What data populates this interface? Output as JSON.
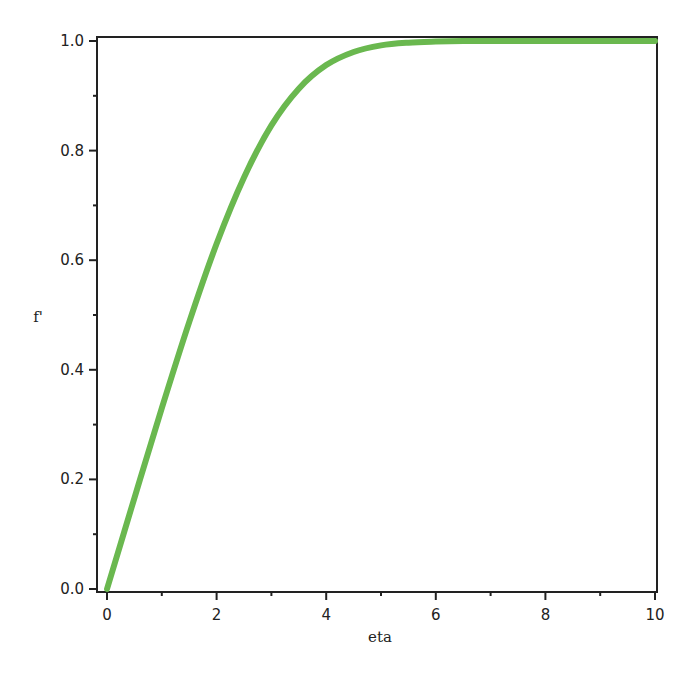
{
  "chart_data": {
    "type": "line",
    "title": "",
    "xlabel": "eta",
    "ylabel": "f'",
    "xlim": [
      0,
      10
    ],
    "ylim": [
      0,
      1.0
    ],
    "x_ticks": [
      "0",
      "2",
      "4",
      "6",
      "8",
      "10"
    ],
    "y_ticks": [
      "0.0",
      "0.2",
      "0.4",
      "0.6",
      "0.8",
      "1.0"
    ],
    "grid": false,
    "legend": null,
    "series": [
      {
        "name": "f'",
        "color": "#6ab84f",
        "x": [
          0,
          0.5,
          1.0,
          1.5,
          2.0,
          2.5,
          3.0,
          3.5,
          4.0,
          4.5,
          5.0,
          5.5,
          6.0,
          6.5,
          7.0,
          7.5,
          8.0,
          8.5,
          9.0,
          9.5,
          10.0
        ],
        "y": [
          0,
          0.166,
          0.33,
          0.487,
          0.63,
          0.751,
          0.846,
          0.913,
          0.956,
          0.98,
          0.992,
          0.997,
          0.999,
          1.0,
          1.0,
          1.0,
          1.0,
          1.0,
          1.0,
          1.0,
          1.0
        ]
      }
    ]
  }
}
